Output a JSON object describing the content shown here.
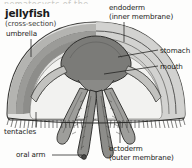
{
  "figure": {
    "title": "jellyfish",
    "subtitle": "(cross-section)",
    "cut_off_header": "nematocysts of the",
    "style": "grayscale pen-and-ink line illustration",
    "labels": [
      {
        "key": "umbrella",
        "text": "umbrella",
        "leader": "vertical-down-right"
      },
      {
        "key": "endoderm",
        "text": "endoderm",
        "leader": "vertical-down"
      },
      {
        "key": "endoderm2",
        "text": "(inner membrane)",
        "leader": "none"
      },
      {
        "key": "stomach",
        "text": "stomach",
        "leader": "horizontal-left"
      },
      {
        "key": "mouth",
        "text": "mouth",
        "leader": "horizontal-left"
      },
      {
        "key": "tentacles",
        "text": "tentacles",
        "leader": "vertical-up-right"
      },
      {
        "key": "oralarm",
        "text": "oral arm",
        "leader": "horizontal-right"
      },
      {
        "key": "ectoderm",
        "text": "ectoderm",
        "leader": "vertical-up"
      },
      {
        "key": "ectoderm2",
        "text": "(outer membrane)",
        "leader": "none"
      }
    ],
    "colors": {
      "background": "#fdfdfc",
      "ink": "#1a1a1a",
      "bell_outer": "#dcdcda",
      "bell_mid": "#b9b9b6",
      "mesoglea": "#8f8f8c",
      "stomach_fill": "#787875",
      "cavity": "#f0f0ee",
      "leader_line": "#2b2b2b"
    }
  }
}
